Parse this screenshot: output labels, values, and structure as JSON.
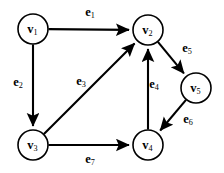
{
  "figure": {
    "type": "directed-graph",
    "width": 224,
    "height": 173,
    "background_color": "#ffffff",
    "stroke_color": "#000000",
    "node_radius": 15
  },
  "nodes": [
    {
      "id": "v1",
      "base": "v",
      "sub": "1",
      "x": 33,
      "y": 29
    },
    {
      "id": "v2",
      "base": "v",
      "sub": "2",
      "x": 148,
      "y": 30
    },
    {
      "id": "v3",
      "base": "v",
      "sub": "3",
      "x": 33,
      "y": 145
    },
    {
      "id": "v4",
      "base": "v",
      "sub": "4",
      "x": 148,
      "y": 145
    },
    {
      "id": "v5",
      "base": "v",
      "sub": "5",
      "x": 196,
      "y": 88
    }
  ],
  "edges": [
    {
      "id": "e1",
      "base": "e",
      "sub": "1",
      "from": "v1",
      "to": "v2",
      "label_x": 90,
      "label_y": 13
    },
    {
      "id": "e2",
      "base": "e",
      "sub": "2",
      "from": "v1",
      "to": "v3",
      "label_x": 18,
      "label_y": 83
    },
    {
      "id": "e3",
      "base": "e",
      "sub": "3",
      "from": "v3",
      "to": "v2",
      "label_x": 81,
      "label_y": 82
    },
    {
      "id": "e4",
      "base": "e",
      "sub": "4",
      "from": "v4",
      "to": "v2",
      "label_x": 154,
      "label_y": 85
    },
    {
      "id": "e5",
      "base": "e",
      "sub": "5",
      "from": "v2",
      "to": "v5",
      "label_x": 187,
      "label_y": 49
    },
    {
      "id": "e6",
      "base": "e",
      "sub": "6",
      "from": "v5",
      "to": "v4",
      "label_x": 188,
      "label_y": 120
    },
    {
      "id": "e7",
      "base": "e",
      "sub": "7",
      "from": "v3",
      "to": "v4",
      "label_x": 90,
      "label_y": 160
    }
  ]
}
